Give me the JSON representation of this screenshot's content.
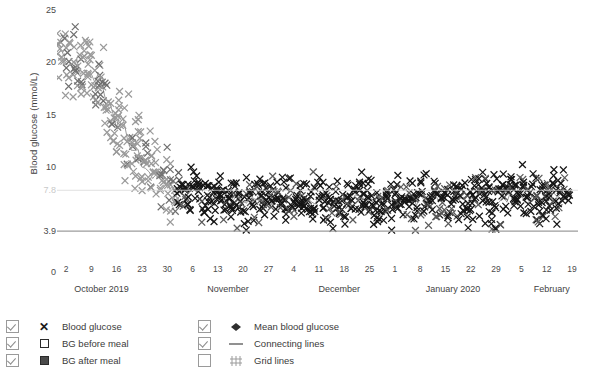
{
  "axes": {
    "y_title": "Blood glucose (mmol/L)",
    "y_ticks": [
      {
        "label": "25",
        "value": 25
      },
      {
        "label": "20",
        "value": 20
      },
      {
        "label": "15",
        "value": 15
      },
      {
        "label": "10",
        "value": 10
      },
      {
        "label": "7.8",
        "value": 7.8
      },
      {
        "label": "3.9",
        "value": 3.9
      },
      {
        "label": "0",
        "value": 0
      }
    ]
  },
  "legend": {
    "left": [
      {
        "label": "Blood glucose",
        "symbol": "x-marker-icon",
        "checked": true
      },
      {
        "label": "BG before meal",
        "symbol": "open-square-icon",
        "checked": true
      },
      {
        "label": "BG after meal",
        "symbol": "filled-square-icon",
        "checked": true
      }
    ],
    "right": [
      {
        "label": "Mean blood glucose",
        "symbol": "diamond-marker-icon",
        "checked": true
      },
      {
        "label": "Connecting lines",
        "symbol": "dash-line-icon",
        "checked": true
      },
      {
        "label": "Grid lines",
        "symbol": "grid-icon",
        "checked": false
      }
    ]
  },
  "chart_data": {
    "type": "scatter",
    "title": "",
    "xlabel": "",
    "ylabel": "Blood glucose (mmol/L)",
    "ylim": [
      0,
      25
    ],
    "grid": false,
    "legend_position": "bottom",
    "reference_lines": [
      {
        "value": 3.9,
        "color": "#9c9c9c",
        "label": "3.9"
      },
      {
        "value": 7.8,
        "color": "#d8d8d8",
        "label": "7.8"
      }
    ],
    "x_tick_labels": [
      "2",
      "9",
      "16",
      "23",
      "30",
      "6",
      "13",
      "20",
      "27",
      "4",
      "11",
      "18",
      "25",
      "1",
      "8",
      "15",
      "22",
      "29",
      "5",
      "12",
      "19"
    ],
    "x_group_labels": [
      "October 2019",
      "November",
      "December",
      "January 2020",
      "February"
    ],
    "x_range": [
      "2019-09-28",
      "2020-02-22"
    ],
    "series": [
      {
        "name": "Blood glucose",
        "marker": "x",
        "color": "#1a1a1a",
        "description": "Dense daily capillary readings; very high (18-25) at start, falling steeply through October to a stable band of roughly 5-9 mmol/L from November onward."
      },
      {
        "name": "Mean blood glucose",
        "marker": "diamond",
        "color": "#808080",
        "description": "Daily mean trace overlaying the scatter, following the same steep decline then plateau near 6.5-7."
      }
    ],
    "weekly_mean_values": [
      22.4,
      19.8,
      18.9,
      14.2,
      10.1,
      8.4,
      7.6,
      7.2,
      7.0,
      6.9,
      6.8,
      6.9,
      7.0,
      6.8,
      6.7,
      6.9,
      7.1,
      6.9,
      7.0,
      7.2,
      7.1
    ],
    "weekly_min_values": [
      17.0,
      15.5,
      13.6,
      9.2,
      6.4,
      5.4,
      4.8,
      4.6,
      4.5,
      4.4,
      4.4,
      4.5,
      4.5,
      4.3,
      4.3,
      4.4,
      4.6,
      4.5,
      4.5,
      4.6,
      4.6
    ],
    "weekly_max_values": [
      25.0,
      24.2,
      22.0,
      19.5,
      14.5,
      11.8,
      10.4,
      9.8,
      9.5,
      9.3,
      9.2,
      9.6,
      9.9,
      9.5,
      9.3,
      9.8,
      10.2,
      9.9,
      10.0,
      10.4,
      10.1
    ]
  }
}
